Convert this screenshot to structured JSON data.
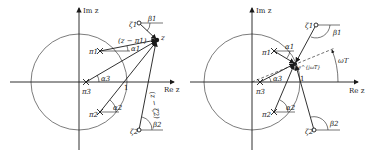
{
  "figure": {
    "left_panel": {
      "axis_x_label": "Re z",
      "axis_y_label": "Im z",
      "unit_label": "1",
      "point_z": "z",
      "poles": [
        "π1",
        "π2",
        "π3"
      ],
      "zeros": [
        "ζ1",
        "ζ2"
      ],
      "pole_angles": [
        "α1",
        "α2",
        "α3"
      ],
      "zero_angles": [
        "β1",
        "β2"
      ],
      "vector_label_pole": "(z − π1)",
      "vector_label_zero": "(z − ζ2)"
    },
    "right_panel": {
      "axis_x_label": "Re z",
      "axis_y_label": "Im z",
      "unit_label": "1",
      "point_label": "e^{jωT}",
      "angle_label": "ωT",
      "poles": [
        "π1",
        "π2",
        "π3"
      ],
      "zeros": [
        "ζ1",
        "ζ2"
      ],
      "pole_angles": [
        "α1",
        "α2",
        "α3"
      ],
      "zero_angles": [
        "β1",
        "β2"
      ]
    }
  }
}
